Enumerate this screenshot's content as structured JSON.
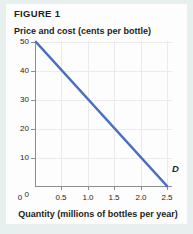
{
  "figure": {
    "title": "FIGURE 1",
    "background_color": "#e7f0ef",
    "card_color": "#fdfdfd"
  },
  "chart_data": {
    "type": "line",
    "title": "FIGURE 1",
    "xlabel": "Quantity (millions of bottles per year)",
    "ylabel": "Price and cost (cents per bottle)",
    "xlim": [
      0,
      2.6
    ],
    "ylim": [
      0,
      52
    ],
    "grid": true,
    "legend": "none",
    "line_color": "#4a6fc0",
    "series": [
      {
        "name": "D",
        "label": "D",
        "label_position": "end-above",
        "x": [
          0,
          2.5
        ],
        "values": [
          50,
          0
        ]
      }
    ],
    "x_ticks": [
      {
        "value": 0,
        "label": "0"
      },
      {
        "value": 0.5,
        "label": "0.5"
      },
      {
        "value": 1.0,
        "label": "1.0"
      },
      {
        "value": 1.5,
        "label": "1.5"
      },
      {
        "value": 2.0,
        "label": "2.0"
      },
      {
        "value": 2.5,
        "label": "2.5"
      }
    ],
    "y_ticks": [
      {
        "value": 0,
        "label": "0"
      },
      {
        "value": 10,
        "label": "10"
      },
      {
        "value": 20,
        "label": "20"
      },
      {
        "value": 30,
        "label": "30"
      },
      {
        "value": 40,
        "label": "40"
      },
      {
        "value": 50,
        "label": "50"
      }
    ]
  }
}
